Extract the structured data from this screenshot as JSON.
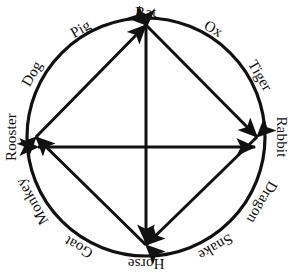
{
  "figure": {
    "shape": "circle",
    "stroke_color": "#111111",
    "background_color": "#ffffff",
    "center": {
      "x": 146,
      "y": 137
    },
    "radius": 119
  },
  "zodiac": {
    "count": 12,
    "order": "clockwise from top",
    "signs": [
      {
        "name": "Rat",
        "angle_deg": 0,
        "position": "top"
      },
      {
        "name": "Ox",
        "angle_deg": 30,
        "position": "upper-right"
      },
      {
        "name": "Tiger",
        "angle_deg": 60,
        "position": "upper-right"
      },
      {
        "name": "Rabbit",
        "angle_deg": 90,
        "position": "right"
      },
      {
        "name": "Dragon",
        "angle_deg": 120,
        "position": "lower-right"
      },
      {
        "name": "Snake",
        "angle_deg": 150,
        "position": "lower-right"
      },
      {
        "name": "Horse",
        "angle_deg": 180,
        "position": "bottom"
      },
      {
        "name": "Goat",
        "angle_deg": 210,
        "position": "lower-left"
      },
      {
        "name": "Monkey",
        "angle_deg": 240,
        "position": "lower-left"
      },
      {
        "name": "Rooster",
        "angle_deg": 270,
        "position": "left"
      },
      {
        "name": "Dog",
        "angle_deg": 300,
        "position": "upper-left"
      },
      {
        "name": "Pig",
        "angle_deg": 330,
        "position": "upper-left"
      }
    ]
  },
  "arrows": {
    "description": "Double-headed arrows forming a diamond plus a central cross",
    "vertices": [
      "Rat",
      "Rabbit",
      "Horse",
      "Rooster"
    ],
    "diamond_edges": [
      {
        "from": "Rat",
        "to": "Rabbit",
        "heads": "both"
      },
      {
        "from": "Rabbit",
        "to": "Horse",
        "heads": "both"
      },
      {
        "from": "Horse",
        "to": "Rooster",
        "heads": "both"
      },
      {
        "from": "Rooster",
        "to": "Rat",
        "heads": "both"
      }
    ],
    "cross_axes": [
      {
        "from": "Rat",
        "to": "Horse",
        "orientation": "vertical",
        "heads": "both"
      },
      {
        "from": "Rooster",
        "to": "Rabbit",
        "orientation": "horizontal",
        "heads": "both"
      }
    ]
  }
}
